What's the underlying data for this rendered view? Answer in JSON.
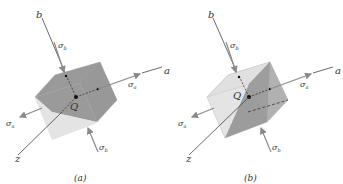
{
  "figure": {
    "panels": [
      {
        "id": "a",
        "caption": "(a)",
        "axes": {
          "a": "a",
          "b": "b",
          "z": "z"
        },
        "stresses": {
          "sigma_a": "σa",
          "sigma_b": "σb"
        },
        "point": "Q",
        "shaded_plane": "plane containing a-axis and z-axis"
      },
      {
        "id": "b",
        "caption": "(b)",
        "axes": {
          "a": "a",
          "b": "b",
          "z": "z"
        },
        "stresses": {
          "sigma_a": "σa",
          "sigma_b": "σb"
        },
        "point": "Q",
        "shaded_plane": "plane containing b-axis and z-axis"
      }
    ],
    "labels": {
      "axis_a": "a",
      "axis_b": "b",
      "axis_z": "z",
      "sigma": "σ",
      "sub_a": "a",
      "sub_b": "b",
      "point_q": "Q",
      "caption_a": "(a)",
      "caption_b": "(b)"
    },
    "colors": {
      "cube_light": "#e4e4e4",
      "cube_mid": "#c8c8c8",
      "cube_dark": "#9a9a9a",
      "plane_dark": "#8c8c8c",
      "axis_line": "#444444",
      "arrow": "#8a8a8a"
    }
  }
}
